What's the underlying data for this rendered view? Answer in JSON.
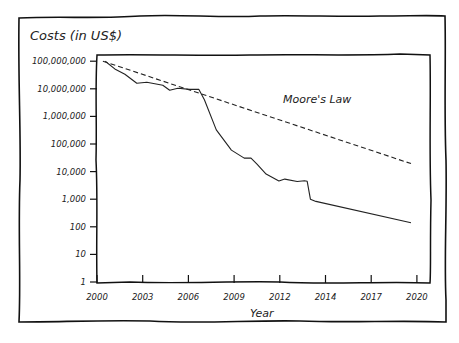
{
  "chart_data": {
    "type": "line",
    "title": "Costs (in US$)",
    "xlabel": "Year",
    "ylabel": "Costs (in US$)",
    "yscale": "log",
    "ylim": [
      1,
      100000000
    ],
    "xlim": [
      2000,
      2021.3
    ],
    "grid": false,
    "x_ticks": [
      {
        "pos": 0,
        "label": "2000"
      },
      {
        "pos": 1,
        "label": "2003"
      },
      {
        "pos": 2,
        "label": "2006"
      },
      {
        "pos": 3,
        "label": "2009"
      },
      {
        "pos": 4,
        "label": "2012"
      },
      {
        "pos": 5,
        "label": "2014"
      },
      {
        "pos": 6,
        "label": "2017"
      },
      {
        "pos": 7,
        "label": "2020"
      }
    ],
    "y_ticks": [
      {
        "log": 8,
        "label": "100,000,000"
      },
      {
        "log": 7,
        "label": "10,000,000"
      },
      {
        "log": 6,
        "label": "1,000,000"
      },
      {
        "log": 5,
        "label": "100,000"
      },
      {
        "log": 4,
        "label": "10,000"
      },
      {
        "log": 3,
        "label": "1,000"
      },
      {
        "log": 2,
        "label": "100"
      },
      {
        "log": 1,
        "label": "10"
      },
      {
        "log": 0,
        "label": "1"
      }
    ],
    "annotations": [
      {
        "text": "Moore's Law",
        "x_pos": 4.07,
        "log": 6.47
      }
    ],
    "series": [
      {
        "name": "Cost",
        "style": "solid",
        "points_pos_log": [
          [
            0.18,
            8.0
          ],
          [
            0.39,
            7.72
          ],
          [
            0.61,
            7.53
          ],
          [
            0.87,
            7.2
          ],
          [
            1.09,
            7.24
          ],
          [
            1.44,
            7.13
          ],
          [
            1.59,
            6.95
          ],
          [
            1.77,
            7.02
          ],
          [
            2.03,
            6.98
          ],
          [
            2.23,
            6.98
          ],
          [
            2.35,
            6.6
          ],
          [
            2.61,
            5.51
          ],
          [
            2.94,
            4.78
          ],
          [
            3.22,
            4.49
          ],
          [
            3.37,
            4.49
          ],
          [
            3.5,
            4.27
          ],
          [
            3.7,
            3.91
          ],
          [
            3.98,
            3.66
          ],
          [
            4.11,
            3.73
          ],
          [
            4.38,
            3.64
          ],
          [
            4.54,
            3.67
          ],
          [
            4.6,
            3.65
          ],
          [
            4.67,
            3.0
          ],
          [
            4.79,
            2.92
          ],
          [
            6.87,
            2.15
          ]
        ]
      },
      {
        "name": "Moore's Law",
        "style": "dashed",
        "points_pos_log": [
          [
            0.13,
            8.0
          ],
          [
            6.87,
            4.29
          ]
        ]
      }
    ]
  }
}
